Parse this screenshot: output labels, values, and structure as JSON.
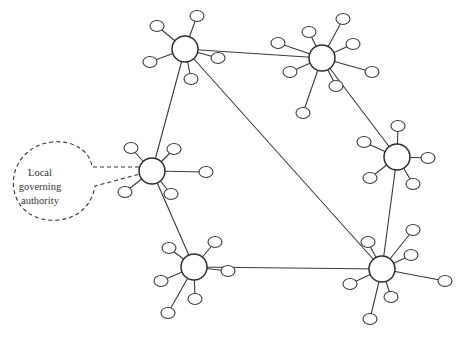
{
  "diagram": {
    "type": "network",
    "callout": {
      "lines": [
        "Local",
        "governing",
        "authority"
      ],
      "points_to": "hub-left-mid"
    },
    "hubs": [
      {
        "id": "hub-top-left",
        "x": 185,
        "y": 49,
        "r": 13,
        "leaves": [
          [
            157,
            26
          ],
          [
            197,
            16
          ],
          [
            218,
            58
          ],
          [
            150,
            62
          ],
          [
            191,
            79
          ]
        ]
      },
      {
        "id": "hub-top-right",
        "x": 322,
        "y": 58,
        "r": 13,
        "leaves": [
          [
            278,
            43
          ],
          [
            309,
            32
          ],
          [
            343,
            19
          ],
          [
            353,
            44
          ],
          [
            372,
            72
          ],
          [
            290,
            72
          ],
          [
            336,
            86
          ],
          [
            303,
            113
          ]
        ]
      },
      {
        "id": "hub-right-mid",
        "x": 397,
        "y": 157,
        "r": 13,
        "leaves": [
          [
            364,
            142
          ],
          [
            398,
            126
          ],
          [
            428,
            158
          ],
          [
            370,
            178
          ],
          [
            413,
            184
          ]
        ]
      },
      {
        "id": "hub-left-mid",
        "x": 152,
        "y": 171,
        "r": 13,
        "leaves": [
          [
            131,
            148
          ],
          [
            174,
            149
          ],
          [
            206,
            172
          ],
          [
            125,
            192
          ],
          [
            171,
            194
          ]
        ]
      },
      {
        "id": "hub-bottom-left",
        "x": 194,
        "y": 267,
        "r": 13,
        "leaves": [
          [
            169,
            248
          ],
          [
            215,
            242
          ],
          [
            228,
            271
          ],
          [
            161,
            281
          ],
          [
            195,
            299
          ],
          [
            168,
            313
          ]
        ]
      },
      {
        "id": "hub-bottom-right",
        "x": 382,
        "y": 269,
        "r": 13,
        "leaves": [
          [
            368,
            242
          ],
          [
            413,
            230
          ],
          [
            411,
            255
          ],
          [
            350,
            284
          ],
          [
            391,
            297
          ],
          [
            445,
            281
          ],
          [
            370,
            319
          ]
        ]
      }
    ],
    "edges": [
      [
        "hub-top-left",
        "hub-top-right"
      ],
      [
        "hub-top-left",
        "hub-left-mid"
      ],
      [
        "hub-top-left",
        "hub-bottom-right"
      ],
      [
        "hub-top-right",
        "hub-right-mid"
      ],
      [
        "hub-right-mid",
        "hub-bottom-right"
      ],
      [
        "hub-left-mid",
        "hub-bottom-left"
      ],
      [
        "hub-bottom-left",
        "hub-bottom-right"
      ]
    ]
  }
}
